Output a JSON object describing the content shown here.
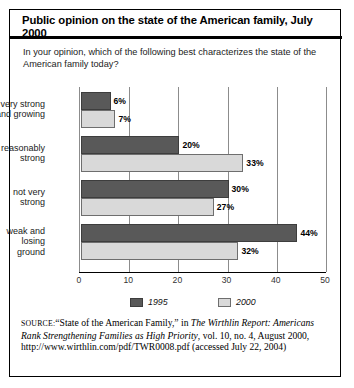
{
  "figure": {
    "title": "Public opinion on the state of the American family, July 2000",
    "subtitle": "In your opinion, which of the following best characterizes the state of the American family today?",
    "source": {
      "label": "Source:",
      "text_1": "“State of the American Family,” in ",
      "italic_1": "The Wirthlin Report: Americans Rank Strengthening Families as High Priority",
      "text_2": ", vol. 10, no. 4, August 2000, http://www.wirthlin.com/pdf/TWR0008.pdf (accessed July 22, 2004)"
    }
  },
  "chart_data": {
    "type": "bar",
    "orientation": "horizontal",
    "title": "Public opinion on the state of the American family, July 2000",
    "question": "In your opinion, which of the following best characterizes the state of the American family today?",
    "categories": [
      "very strong and growing",
      "reasonably strong",
      "not very strong",
      "weak and losing ground"
    ],
    "category_lines": [
      [
        "very strong",
        "and growing"
      ],
      [
        "reasonably",
        "strong"
      ],
      [
        "not very",
        "strong"
      ],
      [
        "weak and",
        "losing",
        "ground"
      ]
    ],
    "series": [
      {
        "name": "1995",
        "color": "#595959",
        "values": [
          6,
          20,
          30,
          44
        ],
        "labels": [
          "6%",
          "20%",
          "30%",
          "44%"
        ]
      },
      {
        "name": "2000",
        "color": "#d9d9d9",
        "values": [
          7,
          33,
          27,
          32
        ],
        "labels": [
          "7%",
          "33%",
          "27%",
          "32%"
        ]
      }
    ],
    "xlabel": "",
    "ylabel": "",
    "xlim": [
      0,
      50
    ],
    "xticks": [
      0,
      10,
      20,
      30,
      40,
      50
    ],
    "xtick_labels": [
      "0",
      "10",
      "20",
      "30",
      "40",
      "50"
    ],
    "grid": true,
    "grid_axis": "x",
    "legend_position": "bottom",
    "value_labels": true,
    "units": "percent"
  }
}
